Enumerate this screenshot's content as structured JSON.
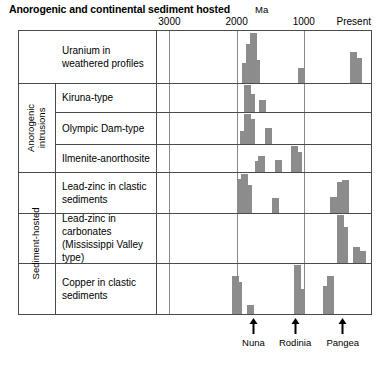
{
  "figure": {
    "title": "Anorogenic and continental sediment hosted",
    "axis_unit_label": "Ma"
  },
  "axis": {
    "ticks": [
      {
        "label": "3000",
        "value": 3000
      },
      {
        "label": "2000",
        "value": 2000
      },
      {
        "label": "1000",
        "value": 1000
      },
      {
        "label": "Present",
        "value": 0
      }
    ],
    "range_max": 3200,
    "range_min": 0,
    "gridlines": [
      3000,
      2000,
      1000
    ]
  },
  "groups": [
    {
      "label": "Anorogenic intrusions",
      "rows": [
        1,
        2,
        3
      ]
    },
    {
      "label": "Sediment-hosted",
      "rows": [
        4,
        5,
        6
      ]
    }
  ],
  "rows": [
    {
      "label": "Uranium in\nweathered profiles",
      "line1": "Uranium in",
      "line2": "weathered profiles"
    },
    {
      "label": "Kiruna-type",
      "line1": "Kiruna-type",
      "line2": ""
    },
    {
      "label": "Olympic Dam-type",
      "line1": "Olympic Dam-type",
      "line2": ""
    },
    {
      "label": "Ilmenite-anorthosite",
      "line1": "Ilmenite-anorthosite",
      "line2": ""
    },
    {
      "label": "Lead-zinc in clastic sediments",
      "line1": "Lead-zinc in clastic",
      "line2": "sediments"
    },
    {
      "label": "Lead-zinc in carbonates (Mississippi Valley type)",
      "line1": "Lead-zinc in carbonates",
      "line2": "(Mississippi Valley type)"
    },
    {
      "label": "Copper in clastic sediments",
      "line1": "Copper in clastic",
      "line2": "sediments"
    }
  ],
  "annotations": [
    {
      "name": "Nuna",
      "value": 1750
    },
    {
      "name": "Rodinia",
      "value": 1130
    },
    {
      "name": "Pangea",
      "value": 420
    }
  ],
  "colors": {
    "bar": "#8c8c8c",
    "frame": "#4a4a4a",
    "gridline": "#8a8a8a",
    "text": "#000000",
    "background": "#ffffff"
  },
  "chart_data": {
    "type": "bar",
    "title": "Anorogenic and continental sediment hosted",
    "xlabel": "Ma",
    "ylabel": "",
    "xlim": [
      3200,
      0
    ],
    "x_axis_reversed": true,
    "grid": true,
    "legend": false,
    "note": "Seven stacked horizontal panels; each panel is a histogram of deposit abundance versus age in Ma. Bar heights are relative abundance within each panel (0-1 scale).",
    "panels": [
      {
        "name": "Uranium in weathered profiles",
        "bars": [
          {
            "age": 1870,
            "height": 0.4
          },
          {
            "age": 1810,
            "height": 0.78
          },
          {
            "age": 1755,
            "height": 1.0
          },
          {
            "age": 1700,
            "height": 0.46
          },
          {
            "age": 1030,
            "height": 0.3
          },
          {
            "age": 260,
            "height": 0.62
          },
          {
            "age": 190,
            "height": 0.5
          }
        ]
      },
      {
        "name": "Kiruna-type",
        "bars": [
          {
            "age": 1835,
            "height": 1.0
          },
          {
            "age": 1775,
            "height": 0.66
          },
          {
            "age": 1620,
            "height": 0.46
          }
        ]
      },
      {
        "name": "Olympic Dam-type",
        "bars": [
          {
            "age": 1895,
            "height": 0.42
          },
          {
            "age": 1840,
            "height": 1.0
          },
          {
            "age": 1780,
            "height": 0.82
          },
          {
            "age": 1530,
            "height": 0.52
          }
        ]
      },
      {
        "name": "Ilmenite-anorthosite",
        "bars": [
          {
            "age": 1680,
            "height": 0.44
          },
          {
            "age": 1625,
            "height": 0.6
          },
          {
            "age": 1380,
            "height": 0.48
          },
          {
            "age": 1140,
            "height": 1.0
          },
          {
            "age": 1080,
            "height": 0.76
          }
        ]
      },
      {
        "name": "Lead-zinc in clastic sediments",
        "bars": [
          {
            "age": 1940,
            "height": 0.86
          },
          {
            "age": 1880,
            "height": 1.0
          },
          {
            "age": 1820,
            "height": 0.72
          },
          {
            "age": 1420,
            "height": 0.38
          },
          {
            "age": 560,
            "height": 0.4
          },
          {
            "age": 460,
            "height": 0.8
          },
          {
            "age": 380,
            "height": 0.84
          }
        ]
      },
      {
        "name": "Lead-zinc in carbonates (Mississippi Valley type)",
        "bars": [
          {
            "age": 450,
            "height": 1.0
          },
          {
            "age": 390,
            "height": 0.74
          },
          {
            "age": 220,
            "height": 0.34
          },
          {
            "age": 120,
            "height": 0.26
          }
        ]
      },
      {
        "name": "Copper in clastic sediments",
        "bars": [
          {
            "age": 2020,
            "height": 0.78
          },
          {
            "age": 1965,
            "height": 0.66
          },
          {
            "age": 1790,
            "height": 0.18
          },
          {
            "age": 1100,
            "height": 1.0
          },
          {
            "age": 1040,
            "height": 0.52
          },
          {
            "age": 660,
            "height": 0.58
          },
          {
            "age": 600,
            "height": 0.78
          }
        ]
      }
    ]
  }
}
